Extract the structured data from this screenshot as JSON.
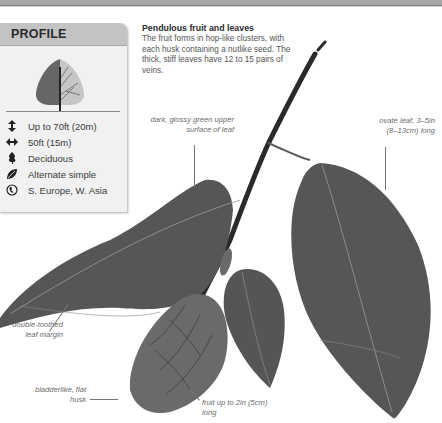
{
  "profile": {
    "title": "PROFILE",
    "facts": [
      {
        "icon": "height-arrow-icon",
        "text": "Up to 70ft (20m)"
      },
      {
        "icon": "width-arrow-icon",
        "text": "50ft (15m)"
      },
      {
        "icon": "deciduous-leaf-icon",
        "text": "Deciduous"
      },
      {
        "icon": "leaf-icon",
        "text": "Alternate simple"
      },
      {
        "icon": "globe-icon",
        "text": "S. Europe, W. Asia"
      }
    ]
  },
  "caption": {
    "title": "Pendulous fruit and leaves",
    "body": "The fruit forms in hop-like clusters, with each husk containing a nutlike seed. The thick, stiff leaves have 12 to 15 pairs of veins."
  },
  "annotations": {
    "upper_surface": "dark, glossy green upper surface of leaf",
    "ovate_leaf": "ovate leaf, 3–5in (8–13cm) long",
    "leaf_margin": "double-toothed leaf margin",
    "husk": "bladderlike, flat husk",
    "fruit": "fruit up to 2in (5cm) long"
  },
  "colors": {
    "header_bg": "#c3c3c3",
    "panel_bg": "#f1f1f1",
    "leaf": "#5a5a5a",
    "annotation_text": "#6b6b6b"
  }
}
